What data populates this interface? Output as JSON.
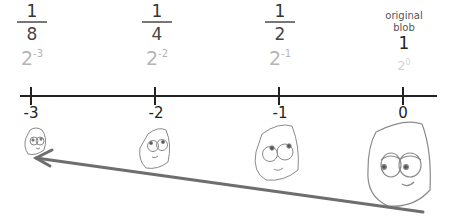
{
  "columns": [
    {
      "numerator": "1",
      "denominator": "8",
      "power_base": "2",
      "power_exp": "-3",
      "tick": "-3"
    },
    {
      "numerator": "1",
      "denominator": "4",
      "power_base": "2",
      "power_exp": "-2",
      "tick": "-2"
    },
    {
      "numerator": "1",
      "denominator": "2",
      "power_base": "2",
      "power_exp": "-1",
      "tick": "-1"
    },
    {
      "label_line1": "original",
      "label_line2": "blob",
      "value": "1",
      "power_base": "2",
      "power_exp": "0",
      "tick": "0"
    }
  ],
  "colors": {
    "axis": "#222222",
    "power_text": "#b5b5b5",
    "blob_outline": "#8a8a8a",
    "arrow": "#6e6e6e"
  },
  "arrow": {
    "direction": "right-to-left",
    "from": [
      423,
      212
    ],
    "to": [
      35,
      158
    ]
  }
}
